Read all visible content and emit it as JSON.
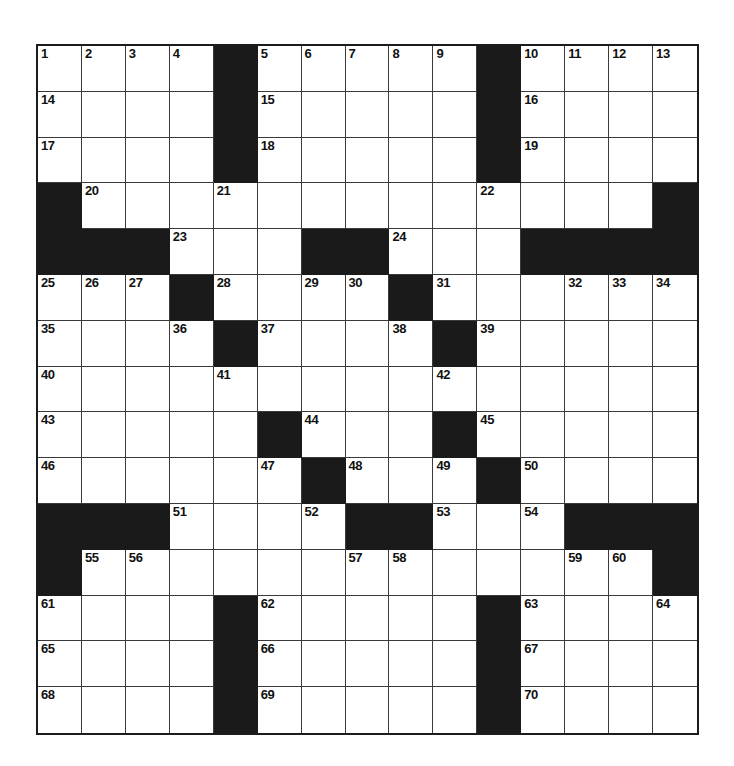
{
  "puzzle": {
    "type": "crossword-grid",
    "title": "",
    "rows": 15,
    "columns": 15,
    "cell_size_px": 44,
    "colors": {
      "block": "#1a1a1a",
      "cell": "#ffffff",
      "grid_line": "#3a3a3a",
      "border": "#1c1c1c",
      "number_text": "#111111"
    },
    "legend": {
      "1": "white cell",
      "0": "black block"
    },
    "grid": [
      [
        1,
        1,
        1,
        1,
        0,
        1,
        1,
        1,
        1,
        1,
        0,
        1,
        1,
        1,
        1
      ],
      [
        1,
        1,
        1,
        1,
        0,
        1,
        1,
        1,
        1,
        1,
        0,
        1,
        1,
        1,
        1
      ],
      [
        1,
        1,
        1,
        1,
        0,
        1,
        1,
        1,
        1,
        1,
        0,
        1,
        1,
        1,
        1
      ],
      [
        0,
        1,
        1,
        1,
        1,
        1,
        1,
        1,
        1,
        1,
        1,
        1,
        1,
        1,
        0
      ],
      [
        0,
        0,
        0,
        1,
        1,
        1,
        0,
        0,
        1,
        1,
        1,
        0,
        0,
        0,
        0
      ],
      [
        1,
        1,
        1,
        0,
        1,
        1,
        1,
        1,
        0,
        1,
        1,
        1,
        1,
        1,
        1
      ],
      [
        1,
        1,
        1,
        1,
        0,
        1,
        1,
        1,
        1,
        0,
        1,
        1,
        1,
        1,
        1
      ],
      [
        1,
        1,
        1,
        1,
        1,
        1,
        1,
        1,
        1,
        1,
        1,
        1,
        1,
        1,
        1
      ],
      [
        1,
        1,
        1,
        1,
        1,
        0,
        1,
        1,
        1,
        0,
        1,
        1,
        1,
        1,
        1
      ],
      [
        1,
        1,
        1,
        1,
        1,
        1,
        0,
        1,
        1,
        1,
        0,
        1,
        1,
        1,
        1
      ],
      [
        0,
        0,
        0,
        1,
        1,
        1,
        1,
        0,
        0,
        1,
        1,
        1,
        0,
        0,
        0
      ],
      [
        0,
        1,
        1,
        1,
        1,
        1,
        1,
        1,
        1,
        1,
        1,
        1,
        1,
        1,
        0
      ],
      [
        1,
        1,
        1,
        1,
        0,
        1,
        1,
        1,
        1,
        1,
        0,
        1,
        1,
        1,
        1
      ],
      [
        1,
        1,
        1,
        1,
        0,
        1,
        1,
        1,
        1,
        1,
        0,
        1,
        1,
        1,
        1
      ],
      [
        1,
        1,
        1,
        1,
        0,
        1,
        1,
        1,
        1,
        1,
        0,
        1,
        1,
        1,
        1
      ]
    ],
    "numbers": [
      {
        "row": 0,
        "col": 0,
        "n": "1"
      },
      {
        "row": 0,
        "col": 1,
        "n": "2"
      },
      {
        "row": 0,
        "col": 2,
        "n": "3"
      },
      {
        "row": 0,
        "col": 3,
        "n": "4"
      },
      {
        "row": 0,
        "col": 5,
        "n": "5"
      },
      {
        "row": 0,
        "col": 6,
        "n": "6"
      },
      {
        "row": 0,
        "col": 7,
        "n": "7"
      },
      {
        "row": 0,
        "col": 8,
        "n": "8"
      },
      {
        "row": 0,
        "col": 9,
        "n": "9"
      },
      {
        "row": 0,
        "col": 11,
        "n": "10"
      },
      {
        "row": 0,
        "col": 12,
        "n": "11"
      },
      {
        "row": 0,
        "col": 13,
        "n": "12"
      },
      {
        "row": 0,
        "col": 14,
        "n": "13"
      },
      {
        "row": 1,
        "col": 0,
        "n": "14"
      },
      {
        "row": 1,
        "col": 5,
        "n": "15"
      },
      {
        "row": 1,
        "col": 11,
        "n": "16"
      },
      {
        "row": 2,
        "col": 0,
        "n": "17"
      },
      {
        "row": 2,
        "col": 5,
        "n": "18"
      },
      {
        "row": 2,
        "col": 11,
        "n": "19"
      },
      {
        "row": 3,
        "col": 1,
        "n": "20"
      },
      {
        "row": 3,
        "col": 4,
        "n": "21"
      },
      {
        "row": 3,
        "col": 10,
        "n": "22"
      },
      {
        "row": 4,
        "col": 3,
        "n": "23"
      },
      {
        "row": 4,
        "col": 8,
        "n": "24"
      },
      {
        "row": 5,
        "col": 0,
        "n": "25"
      },
      {
        "row": 5,
        "col": 1,
        "n": "26"
      },
      {
        "row": 5,
        "col": 2,
        "n": "27"
      },
      {
        "row": 5,
        "col": 4,
        "n": "28"
      },
      {
        "row": 5,
        "col": 6,
        "n": "29"
      },
      {
        "row": 5,
        "col": 7,
        "n": "30"
      },
      {
        "row": 5,
        "col": 9,
        "n": "31"
      },
      {
        "row": 5,
        "col": 12,
        "n": "32"
      },
      {
        "row": 5,
        "col": 13,
        "n": "33"
      },
      {
        "row": 5,
        "col": 14,
        "n": "34"
      },
      {
        "row": 6,
        "col": 0,
        "n": "35"
      },
      {
        "row": 6,
        "col": 3,
        "n": "36"
      },
      {
        "row": 6,
        "col": 5,
        "n": "37"
      },
      {
        "row": 6,
        "col": 8,
        "n": "38"
      },
      {
        "row": 6,
        "col": 10,
        "n": "39"
      },
      {
        "row": 7,
        "col": 0,
        "n": "40"
      },
      {
        "row": 7,
        "col": 4,
        "n": "41"
      },
      {
        "row": 7,
        "col": 9,
        "n": "42"
      },
      {
        "row": 8,
        "col": 0,
        "n": "43"
      },
      {
        "row": 8,
        "col": 6,
        "n": "44"
      },
      {
        "row": 8,
        "col": 10,
        "n": "45"
      },
      {
        "row": 9,
        "col": 0,
        "n": "46"
      },
      {
        "row": 9,
        "col": 5,
        "n": "47"
      },
      {
        "row": 9,
        "col": 7,
        "n": "48"
      },
      {
        "row": 9,
        "col": 9,
        "n": "49"
      },
      {
        "row": 9,
        "col": 11,
        "n": "50"
      },
      {
        "row": 10,
        "col": 3,
        "n": "51"
      },
      {
        "row": 10,
        "col": 6,
        "n": "52"
      },
      {
        "row": 10,
        "col": 9,
        "n": "53"
      },
      {
        "row": 10,
        "col": 11,
        "n": "54"
      },
      {
        "row": 11,
        "col": 1,
        "n": "55"
      },
      {
        "row": 11,
        "col": 2,
        "n": "56"
      },
      {
        "row": 11,
        "col": 7,
        "n": "57"
      },
      {
        "row": 11,
        "col": 8,
        "n": "58"
      },
      {
        "row": 11,
        "col": 12,
        "n": "59"
      },
      {
        "row": 11,
        "col": 13,
        "n": "60"
      },
      {
        "row": 12,
        "col": 0,
        "n": "61"
      },
      {
        "row": 12,
        "col": 5,
        "n": "62"
      },
      {
        "row": 12,
        "col": 11,
        "n": "63"
      },
      {
        "row": 12,
        "col": 14,
        "n": "64"
      },
      {
        "row": 13,
        "col": 0,
        "n": "65"
      },
      {
        "row": 13,
        "col": 5,
        "n": "66"
      },
      {
        "row": 13,
        "col": 11,
        "n": "67"
      },
      {
        "row": 14,
        "col": 0,
        "n": "68"
      },
      {
        "row": 14,
        "col": 5,
        "n": "69"
      },
      {
        "row": 14,
        "col": 11,
        "n": "70"
      }
    ]
  }
}
